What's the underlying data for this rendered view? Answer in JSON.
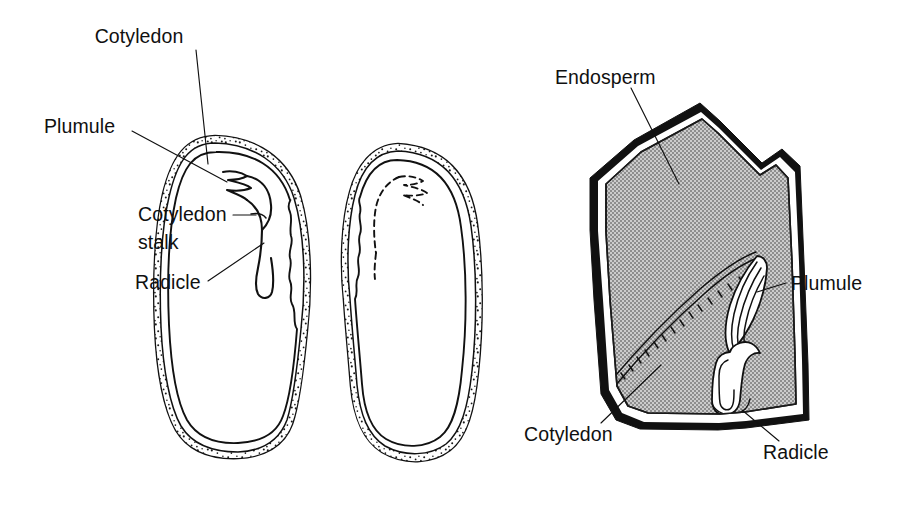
{
  "figure": {
    "background_color": "#ffffff",
    "ink_color": "#111111",
    "endosperm_fill_color": "#b4b4b4",
    "width": 913,
    "height": 507
  },
  "labels": {
    "cotyledon_top": "Cotyledon",
    "plumule_left": "Plumule",
    "cotyledon_stalk_line1": "Cotyledon",
    "cotyledon_stalk_line2": "stalk",
    "radicle_left": "Radicle",
    "endosperm": "Endosperm",
    "plumule_right": "Plumule",
    "cotyledon_bottom": "Cotyledon",
    "radicle_right": "Radicle"
  },
  "specimens": [
    {
      "id": "bean-half-left",
      "name": "Bean seed half with embryo",
      "type": "dicot-cotyledon",
      "parts": [
        "seed coat",
        "cotyledon",
        "plumule",
        "cotyledon stalk",
        "radicle"
      ]
    },
    {
      "id": "bean-half-right",
      "name": "Bean seed opposite half showing embryo imprint",
      "type": "dicot-cotyledon",
      "parts": [
        "seed coat",
        "cotyledon",
        "embryo imprint"
      ]
    },
    {
      "id": "corn-grain",
      "name": "Corn grain longitudinal section",
      "type": "monocot-caryopsis",
      "parts": [
        "pericarp",
        "endosperm",
        "cotyledon",
        "plumule",
        "radicle"
      ]
    }
  ]
}
